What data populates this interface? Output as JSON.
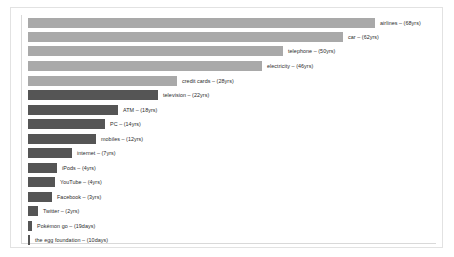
{
  "figure": {
    "background_color": "#ffffff",
    "frame_border_color": "#e2e2e2",
    "axis_color": "#d9d9d9"
  },
  "chart_data": {
    "type": "bar",
    "orientation": "horizontal",
    "title": "",
    "subtitle": "",
    "xlabel": "",
    "ylabel": "",
    "grid": false,
    "legend": "none",
    "value_unit_note": "years unless noted as days",
    "categories": [
      "airlines",
      "car",
      "telephone",
      "electricity",
      "credit cards",
      "television",
      "ATM",
      "PC",
      "mobiles",
      "internet",
      "iPods",
      "YouTube",
      "Facebook",
      "Twitter",
      "Pokémon go",
      "the egg foundation"
    ],
    "values": [
      68,
      62,
      50,
      46,
      28,
      22,
      18,
      14,
      12,
      7,
      4,
      4,
      3,
      2,
      19,
      10
    ],
    "units": [
      "yrs",
      "yrs",
      "yrs",
      "yrs",
      "yrs",
      "yrs",
      "yrs",
      "yrs",
      "yrs",
      "yrs",
      "yrs",
      "yrs",
      "yrs",
      "yrs",
      "days",
      "days"
    ],
    "colors": [
      "#a9a9a9",
      "#a9a9a9",
      "#a9a9a9",
      "#a9a9a9",
      "#a9a9a9",
      "#555555",
      "#555555",
      "#555555",
      "#555555",
      "#555555",
      "#555555",
      "#555555",
      "#555555",
      "#555555",
      "#555555",
      "#555555"
    ]
  },
  "bars": [
    {
      "label": "airlines – (68yrs)",
      "width": 347,
      "top": 18,
      "color": "#a9a9a9"
    },
    {
      "label": "car – (62yrs)",
      "width": 315,
      "top": 32,
      "color": "#a9a9a9"
    },
    {
      "label": "telephone – (50yrs)",
      "width": 255,
      "top": 46,
      "color": "#a9a9a9"
    },
    {
      "label": "electricity – (46yrs)",
      "width": 234,
      "top": 61,
      "color": "#a9a9a9"
    },
    {
      "label": "credit cards – (28yrs)",
      "width": 149,
      "top": 76,
      "color": "#a9a9a9"
    },
    {
      "label": "television – (22yrs)",
      "width": 130,
      "top": 90,
      "color": "#555555"
    },
    {
      "label": "ATM – (18yrs)",
      "width": 90,
      "top": 105,
      "color": "#555555"
    },
    {
      "label": "PC – (14yrs)",
      "width": 77,
      "top": 119,
      "color": "#555555"
    },
    {
      "label": "mobiles  – (12yrs)",
      "width": 68,
      "top": 134,
      "color": "#555555"
    },
    {
      "label": "internet – (7yrs)",
      "width": 44,
      "top": 148,
      "color": "#555555"
    },
    {
      "label": "iPods – (4yrs)",
      "width": 29,
      "top": 163,
      "color": "#555555"
    },
    {
      "label": "YouTube – (4yrs)",
      "width": 27,
      "top": 177,
      "color": "#555555"
    },
    {
      "label": "Facebook – (3yrs)",
      "width": 24,
      "top": 192,
      "color": "#555555"
    },
    {
      "label": "Twitter – (2yrs)",
      "width": 10,
      "top": 206,
      "color": "#555555"
    },
    {
      "label": "Pokémon go – (19days)",
      "width": 4,
      "top": 221,
      "color": "#555555"
    },
    {
      "label": "the egg foundation – (10days)",
      "width": 2,
      "top": 235,
      "color": "#555555"
    }
  ]
}
